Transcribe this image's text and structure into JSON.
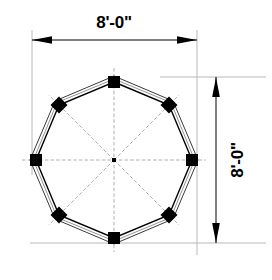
{
  "drawing": {
    "title": "Octagon Plan Dimension Drawing",
    "background_color": "#ffffff",
    "line_color": "#000000",
    "extension_line_color": "#b8b8b8",
    "centerline_color": "#9a9a9a",
    "marker_fill": "#000000"
  },
  "dimensions": {
    "horizontal": {
      "label": "8'-0\"",
      "orientation": "horizontal",
      "arrow_left": "arrow-left",
      "arrow_right": "arrow-right",
      "text_x": 114,
      "text_y": 27,
      "line_y": 40,
      "line_x1": 32,
      "line_x2": 197
    },
    "vertical": {
      "label": "8'-0\"",
      "orientation": "vertical-rotated-90ccw",
      "arrow_top": "arrow-up",
      "arrow_bottom": "arrow-down",
      "text_x": 243,
      "text_y": 160,
      "line_x": 216,
      "line_y1": 77,
      "line_y2": 243
    }
  },
  "geometry": {
    "shape": "octagon",
    "sides": 8,
    "center_x": 114,
    "center_y": 160,
    "outer_radius": 84,
    "wall_thickness": 5,
    "rotation_deg": 0,
    "vertices": [
      {
        "index": 0,
        "angle_deg": -90,
        "marker": "square",
        "position": "top"
      },
      {
        "index": 1,
        "angle_deg": -45,
        "marker": "diamond",
        "position": "top-right"
      },
      {
        "index": 2,
        "angle_deg": 0,
        "marker": "square",
        "position": "right"
      },
      {
        "index": 3,
        "angle_deg": 45,
        "marker": "diamond",
        "position": "bottom-right"
      },
      {
        "index": 4,
        "angle_deg": 90,
        "marker": "square",
        "position": "bottom"
      },
      {
        "index": 5,
        "angle_deg": 135,
        "marker": "diamond",
        "position": "bottom-left"
      },
      {
        "index": 6,
        "angle_deg": 180,
        "marker": "square",
        "position": "left"
      },
      {
        "index": 7,
        "angle_deg": -135,
        "marker": "diamond",
        "position": "top-left"
      }
    ],
    "centerlines": {
      "count": 8,
      "angles_deg": [
        0,
        45,
        90,
        135,
        180,
        225,
        270,
        315
      ],
      "length": 92
    }
  }
}
